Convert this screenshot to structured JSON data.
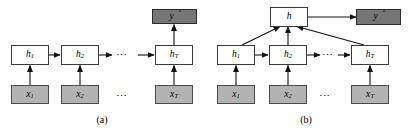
{
  "figure": {
    "width": 408,
    "height": 133,
    "background": "#ffffff",
    "colors": {
      "input_box_fill": "#b3b3b3",
      "hidden_box_fill": "#ffffff",
      "output_box_fill": "#767676",
      "stroke": "#3a3a3a",
      "text": "#000000"
    }
  },
  "panel_a": {
    "caption": "(a)",
    "output": {
      "label": "y",
      "accent": "̂"
    },
    "hidden": [
      {
        "label": "h",
        "sub": "1"
      },
      {
        "label": "h",
        "sub": "2"
      },
      {
        "label": "h",
        "sub": "T"
      }
    ],
    "inputs": [
      {
        "label": "x",
        "sub": "1"
      },
      {
        "label": "x",
        "sub": "2"
      },
      {
        "label": "x",
        "sub": "T"
      }
    ],
    "hidden_ellipsis": "⋯",
    "input_ellipsis": "⋯"
  },
  "panel_b": {
    "caption": "(b)",
    "pooling": {
      "label": "h"
    },
    "output": {
      "label": "y",
      "accent": "̂"
    },
    "hidden": [
      {
        "label": "h",
        "sub": "1"
      },
      {
        "label": "h",
        "sub": "2"
      },
      {
        "label": "h",
        "sub": "T"
      }
    ],
    "inputs": [
      {
        "label": "x",
        "sub": "1"
      },
      {
        "label": "x",
        "sub": "2"
      },
      {
        "label": "x",
        "sub": "T"
      }
    ],
    "hidden_ellipsis": "⋯",
    "input_ellipsis": "⋯"
  }
}
